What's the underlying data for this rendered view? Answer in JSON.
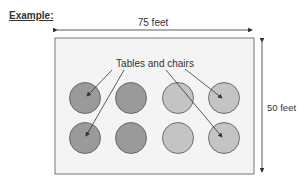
{
  "heading": "Example:",
  "dimensions": {
    "width_label": "75 feet",
    "height_label": "50 feet"
  },
  "callout": "Tables and chairs",
  "tables": {
    "rows": 2,
    "columns": 4,
    "colors": [
      "#9a9a9a",
      "#9a9a9a",
      "#c4c4c4",
      "#c4c4c4"
    ]
  },
  "colors": {
    "room_fill": "#f4f4f4",
    "outline": "#555555",
    "dark_table": "#9a9a9a",
    "light_table": "#c4c4c4"
  }
}
